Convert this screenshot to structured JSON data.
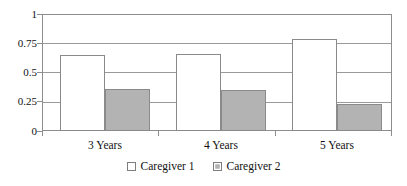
{
  "chart_data": {
    "type": "bar",
    "title": "",
    "subtitle": "",
    "xlabel": "",
    "ylabel": "",
    "categories": [
      "3 Years",
      "4 Years",
      "5 Years"
    ],
    "series": [
      {
        "name": "Caregiver 1",
        "color": "#ffffff",
        "values": [
          0.65,
          0.66,
          0.79
        ]
      },
      {
        "name": "Caregiver 2",
        "color": "#b3b3b3",
        "values": [
          0.36,
          0.35,
          0.23
        ]
      }
    ],
    "ylim": [
      0,
      1
    ],
    "ytick_labels": [
      "1",
      "0.75",
      "0.5",
      "0.25",
      "0"
    ],
    "ytick_values": [
      1,
      0.75,
      0.5,
      0.25,
      0
    ],
    "grid": true,
    "grid_axis": "y",
    "legend_position": "bottom-center",
    "annotations": []
  },
  "legend": {
    "entries": [
      {
        "label": "Caregiver 1",
        "swatch": "white-square-swatch"
      },
      {
        "label": "Caregiver 2",
        "swatch": "gray-square-swatch"
      }
    ]
  }
}
